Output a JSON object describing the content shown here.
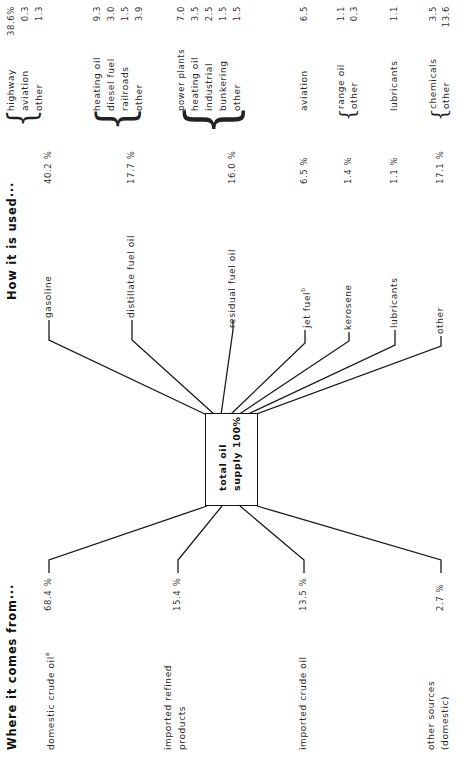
{
  "titles": {
    "sources": "Where it comes from···",
    "uses": "How it is used···"
  },
  "center": {
    "line1": "total oil",
    "line2": "supply 100%"
  },
  "sources": [
    {
      "label": "domestic crude oil",
      "footnote": "a",
      "percent": "68.4 %"
    },
    {
      "label": "imported refined",
      "label2": "products",
      "percent": "15.4 %"
    },
    {
      "label": "imported crude oil",
      "percent": "13.5 %"
    },
    {
      "label": "other sources",
      "label2": "(domestic)",
      "percent": "2.7 %"
    }
  ],
  "products": [
    {
      "label": "gasoline",
      "percent": "40.2 %",
      "uses": [
        {
          "label": "highway",
          "value": "38.6%"
        },
        {
          "label": "aviation",
          "value": "0.3"
        },
        {
          "label": "other",
          "value": "1.3"
        }
      ]
    },
    {
      "label": "distillate fuel oil",
      "percent": "17.7 %",
      "uses": [
        {
          "label": "heating oil",
          "value": "9.3"
        },
        {
          "label": "diesel fuel",
          "value": "3.0"
        },
        {
          "label": "railroads",
          "value": "1.5"
        },
        {
          "label": "other",
          "value": "3.9"
        }
      ]
    },
    {
      "label": "residual fuel oil",
      "percent": "16.0 %",
      "uses": [
        {
          "label": "power plants",
          "value": "7.0"
        },
        {
          "label": "heating oil",
          "value": "3.5"
        },
        {
          "label": "industrial",
          "value": "2.5"
        },
        {
          "label": "bunkering",
          "value": "1.5"
        },
        {
          "label": "other",
          "value": "1.5"
        }
      ]
    },
    {
      "label": "jet fuel",
      "footnote": "b",
      "percent": "6.5 %",
      "uses": [
        {
          "label": "aviation",
          "value": "6.5"
        }
      ]
    },
    {
      "label": "kerosene",
      "percent": "1.4 %",
      "uses": [
        {
          "label": "range oil",
          "value": "1.1"
        },
        {
          "label": "other",
          "value": "0.3"
        }
      ]
    },
    {
      "label": "lubricants",
      "percent": "1.1 %",
      "uses": [
        {
          "label": "lubricants",
          "value": "1.1"
        }
      ]
    },
    {
      "label": "other",
      "percent": "17.1 %",
      "uses": [
        {
          "label": "chemicals",
          "value": "3.5"
        },
        {
          "label": "other",
          "value": "13.6"
        }
      ]
    }
  ],
  "colors": {
    "ink": "#222222",
    "background": "#ffffff"
  }
}
